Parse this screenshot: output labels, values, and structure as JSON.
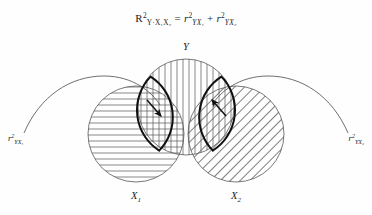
{
  "figure": {
    "type": "venn-diagram",
    "title_equation": {
      "lhs_symbol": "R",
      "lhs_exponent": "2",
      "lhs_subscript": "Y·X₁X₂",
      "equals": "=",
      "term1_symbol": "r",
      "term1_exponent": "2",
      "term1_subscript": "YX₁",
      "plus": "+",
      "term2_symbol": "r",
      "term2_exponent": "2",
      "term2_subscript": "YX₂",
      "plain": "R² Y·X₁X₂ = r² YX₁ + r² YX₂"
    },
    "circles": [
      {
        "id": "Y",
        "label": "Y",
        "label_sub": "",
        "hatch": "vertical",
        "position": "top-center"
      },
      {
        "id": "X1",
        "label": "X",
        "label_sub": "1",
        "hatch": "horizontal",
        "position": "bottom-left"
      },
      {
        "id": "X2",
        "label": "X",
        "label_sub": "2",
        "hatch": "diagonal",
        "position": "bottom-right"
      }
    ],
    "overlap_labels": [
      {
        "id": "left",
        "symbol": "r",
        "exponent": "2",
        "subscript": "YX₁",
        "plain": "r² YX₁"
      },
      {
        "id": "right",
        "symbol": "r",
        "exponent": "2",
        "subscript": "YX₂",
        "plain": "r² YX₂"
      }
    ],
    "colors": {
      "background": "#fefefe",
      "outline": "#4d4d4d",
      "hatch": "#555555",
      "emphasis": "#111111",
      "text": "#1d1d1d"
    }
  }
}
